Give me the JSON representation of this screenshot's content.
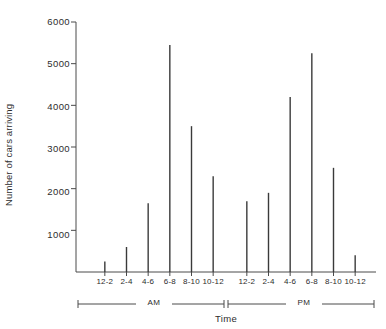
{
  "chart_data": {
    "type": "bar",
    "title": "",
    "subtitle": "",
    "xlabel": "Time",
    "ylabel": "Number of cars arriving",
    "categories": [
      "12-2",
      "2-4",
      "4-6",
      "6-8",
      "8-10",
      "10-12",
      "12-2",
      "2-4",
      "4-6",
      "6-8",
      "8-10",
      "10-12"
    ],
    "groups": [
      {
        "name": "AM",
        "categories": [
          "12-2",
          "2-4",
          "4-6",
          "6-8",
          "8-10",
          "10-12"
        ]
      },
      {
        "name": "PM",
        "categories": [
          "12-2",
          "2-4",
          "4-6",
          "6-8",
          "8-10",
          "10-12"
        ]
      }
    ],
    "values": [
      250,
      600,
      1650,
      5450,
      3500,
      2300,
      1700,
      1900,
      4200,
      5250,
      2500,
      400
    ],
    "ylim": [
      0,
      6000
    ],
    "yticks": [
      1000,
      2000,
      3000,
      4000,
      5000,
      6000
    ],
    "ytick_labels": [
      "1000",
      "2000",
      "3000",
      "4000",
      "5000",
      "6000"
    ],
    "grid": false,
    "legend": "none",
    "bar_color": "#3a3a3a",
    "axis_color": "#4a4a4a"
  },
  "axes": {
    "y_title": "Number of cars arriving",
    "x_title": "Time",
    "y_ticks": [
      "6000",
      "5000",
      "4000",
      "3000",
      "2000",
      "1000"
    ],
    "x_ticks": [
      "12-2",
      "2-4",
      "4-6",
      "6-8",
      "8-10",
      "10-12",
      "12-2",
      "2-4",
      "4-6",
      "6-8",
      "8-10",
      "10-12"
    ],
    "period_am": "AM",
    "period_pm": "PM"
  }
}
